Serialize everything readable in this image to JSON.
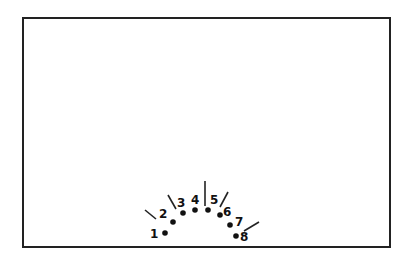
{
  "frame": {
    "border_color": "#222222",
    "background": "#ffffff"
  },
  "diagram": {
    "points": [
      {
        "label": "1",
        "x": 165,
        "y": 233,
        "lx": 150,
        "ly": 238
      },
      {
        "label": "2",
        "x": 173,
        "y": 222,
        "lx": 159,
        "ly": 218
      },
      {
        "label": "3",
        "x": 183,
        "y": 213,
        "lx": 177,
        "ly": 207
      },
      {
        "label": "4",
        "x": 195,
        "y": 210,
        "lx": 191,
        "ly": 204
      },
      {
        "label": "5",
        "x": 208,
        "y": 210,
        "lx": 210,
        "ly": 204
      },
      {
        "label": "6",
        "x": 220,
        "y": 215,
        "lx": 223,
        "ly": 216
      },
      {
        "label": "7",
        "x": 230,
        "y": 225,
        "lx": 235,
        "ly": 226
      },
      {
        "label": "8",
        "x": 236,
        "y": 236,
        "lx": 240,
        "ly": 241
      }
    ],
    "lines": [
      {
        "x1": 145,
        "y1": 210,
        "x2": 156,
        "y2": 219
      },
      {
        "x1": 168,
        "y1": 195,
        "x2": 176,
        "y2": 209
      },
      {
        "x1": 205,
        "y1": 181,
        "x2": 205,
        "y2": 206
      },
      {
        "x1": 228,
        "y1": 192,
        "x2": 220,
        "y2": 207
      },
      {
        "x1": 244,
        "y1": 231,
        "x2": 259,
        "y2": 222
      }
    ],
    "point_color": "#111111",
    "line_color": "#222222"
  }
}
